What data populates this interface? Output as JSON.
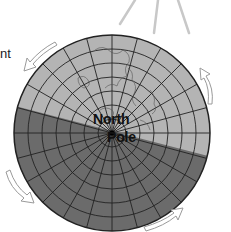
{
  "diagram": {
    "left_label_fragment": "nt",
    "pole_label_line1": "North",
    "pole_label_line2": "Pole",
    "colors": {
      "day_side": "#b4b4b4",
      "night_side": "#6b6b6b",
      "grid": "#222222",
      "sun_rays": "#c8c8c8",
      "arrows": "#9a9a9a"
    },
    "elements": {
      "sun_rays_count": 3,
      "rotation_arrows_count": 4,
      "globe": "polar projection of Earth with latitude circles and longitude meridians, half lit by sun"
    }
  }
}
